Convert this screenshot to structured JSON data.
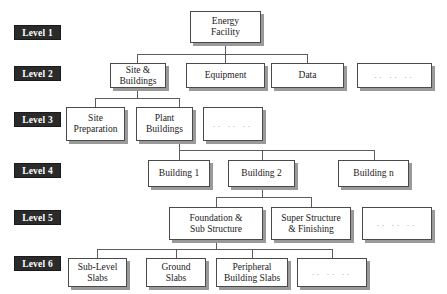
{
  "diagram": {
    "type": "hierarchy-tree",
    "levels": [
      {
        "label": "Level 1"
      },
      {
        "label": "Level 2"
      },
      {
        "label": "Level 3"
      },
      {
        "label": "Level 4"
      },
      {
        "label": "Level 5"
      },
      {
        "label": "Level 6"
      }
    ],
    "ellipsis_text": ".. .. ..",
    "colors": {
      "level_tag_background": "#2b2b2b",
      "level_tag_text": "#ffffff",
      "node_background": "#ffffff",
      "node_border": "#4a4a4a",
      "node_shadow": "#9a9a9a",
      "connector": "#5c5c5c",
      "page_background": "#ffffff"
    },
    "nodes": {
      "l1_energy_facility": "Energy\nFacility",
      "l2_site_buildings": "Site &\nBuildings",
      "l2_equipment": "Equipment",
      "l2_data": "Data",
      "l2_more": ".. .. ..",
      "l3_site_preparation": "Site\nPreparation",
      "l3_plant_buildings": "Plant\nBuildings",
      "l3_more": ".. .. ..",
      "l4_building_1": "Building 1",
      "l4_building_2": "Building 2",
      "l4_building_n": "Building n",
      "l5_foundation": "Foundation &\nSub Structure",
      "l5_super_structure": "Super Structure\n& Finishing",
      "l5_more": ".. .. ..",
      "l6_sub_level_slabs": "Sub-Level\nSlabs",
      "l6_ground_slabs": "Ground\nSlabs",
      "l6_peripheral_slabs": "Peripheral\nBuilding Slabs",
      "l6_more": ".. .. .."
    }
  }
}
